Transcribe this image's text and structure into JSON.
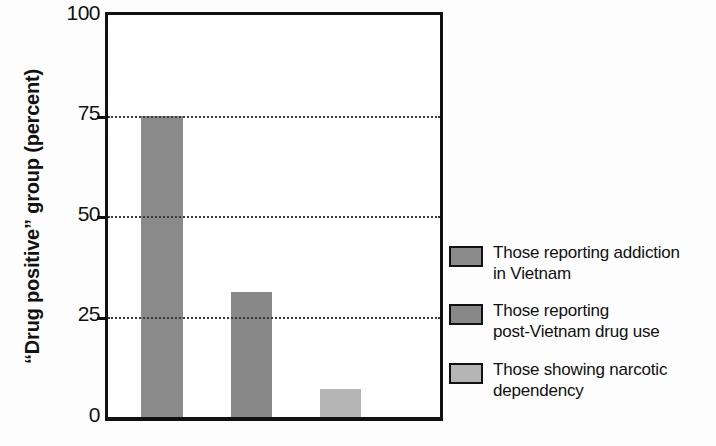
{
  "chart_data": {
    "type": "bar",
    "title": "",
    "xlabel": "",
    "ylabel": "“Drug positive” group (percent)",
    "ylim": [
      0,
      100
    ],
    "yticks": [
      "0",
      "25",
      "50",
      "75",
      "100"
    ],
    "ytick_values": [
      0,
      25,
      50,
      75,
      100
    ],
    "gridlines_at": [
      25,
      50,
      75
    ],
    "grid": true,
    "legend_position": "right",
    "categories": [
      "Those reporting addiction in Vietnam",
      "Those reporting post-Vietnam drug use",
      "Those showing narcotic dependency"
    ],
    "values": [
      75,
      31,
      7
    ],
    "colors": [
      "#8a8a8a",
      "#888888",
      "#b5b5b5"
    ]
  },
  "axis": {
    "ticks": [
      {
        "label": "100",
        "value": 100
      },
      {
        "label": "75",
        "value": 75
      },
      {
        "label": "50",
        "value": 50
      },
      {
        "label": "25",
        "value": 25
      },
      {
        "label": "0",
        "value": 0
      }
    ],
    "ylabel": "“Drug positive” group (percent)"
  },
  "legend": {
    "items": [
      {
        "line1": "Those reporting addiction",
        "line2": "in Vietnam",
        "color": "#8a8a8a"
      },
      {
        "line1": "Those reporting",
        "line2": "post-Vietnam drug use",
        "color": "#888888"
      },
      {
        "line1": "Those showing narcotic",
        "line2": "dependency",
        "color": "#b5b5b5"
      }
    ]
  }
}
